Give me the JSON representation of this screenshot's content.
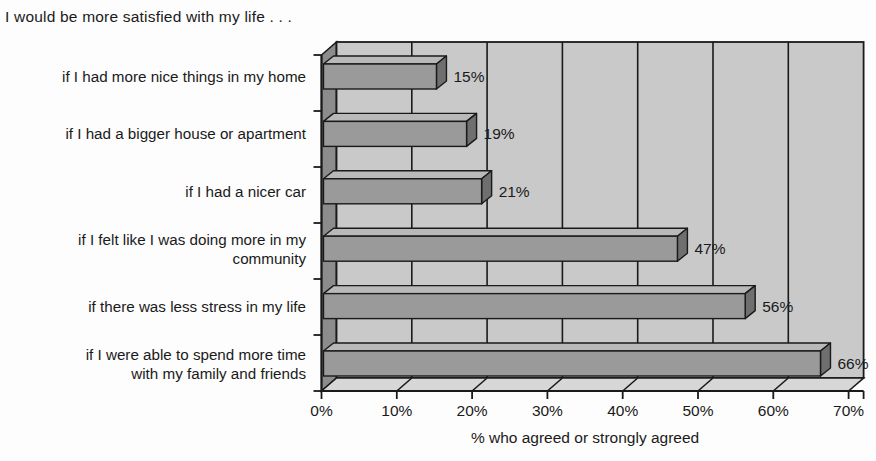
{
  "title": "I would be more satisfied with my life . . .",
  "chart_data": {
    "type": "bar",
    "orientation": "horizontal",
    "style": "3d-extruded-bars",
    "title": "I would be more satisfied with my life . . .",
    "categories": [
      "if I had more nice things in my home",
      "if I had a bigger house or apartment",
      "if I had a nicer car",
      "if I felt like I was doing more in my\ncommunity",
      "if there was less stress in my life",
      "if I were able to spend more time\nwith my family and friends"
    ],
    "values": [
      15,
      19,
      21,
      47,
      56,
      66
    ],
    "data_labels": [
      "15%",
      "19%",
      "21%",
      "47%",
      "56%",
      "66%"
    ],
    "xlabel": "% who agreed or strongly agreed",
    "ylabel": "",
    "xlim": [
      0,
      70
    ],
    "xtick_interval": 10,
    "xticks": [
      "0%",
      "10%",
      "20%",
      "30%",
      "40%",
      "50%",
      "60%",
      "70%"
    ],
    "grid": true,
    "legend": false
  },
  "colors": {
    "bar_front": "#9a9a9a",
    "bar_top": "#b9b9b9",
    "bar_side": "#6f6f6f",
    "back_wall": "#c9c9c9",
    "side_wall": "#8c8c8c",
    "floor": "#d7d7d7",
    "line": "#1a1a1a",
    "text": "#1a1a1a",
    "background": "#fdfdfd"
  }
}
